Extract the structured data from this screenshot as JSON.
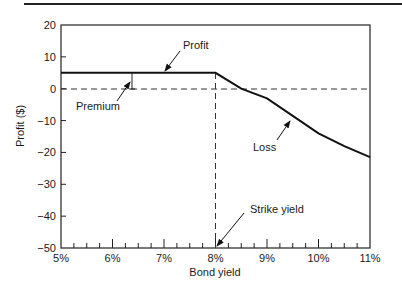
{
  "chart_data": {
    "type": "line",
    "title": "",
    "xlabel": "Bond yield",
    "ylabel": "Profit ($)",
    "xlim": [
      5,
      11
    ],
    "ylim": [
      -50,
      20
    ],
    "x_ticks": [
      "5%",
      "6%",
      "7%",
      "8%",
      "9%",
      "10%",
      "11%"
    ],
    "y_ticks": [
      "20",
      "10",
      "0",
      "−10",
      "−20",
      "−30",
      "−40",
      "−50"
    ],
    "grid": false,
    "legend": null,
    "series": [
      {
        "name": "Profit/Loss",
        "x": [
          5.0,
          8.0,
          8.5,
          9.0,
          9.5,
          10.0,
          10.5,
          11.0
        ],
        "y": [
          5,
          5,
          0,
          -3,
          -8.5,
          -14,
          -18,
          -21.5
        ]
      }
    ],
    "reference_lines": [
      {
        "type": "horizontal",
        "y": 0,
        "style": "dashed"
      },
      {
        "type": "vertical",
        "x": 8.0,
        "style": "dashed"
      }
    ],
    "annotations": [
      {
        "text": "Profit",
        "target_x": 6.7,
        "target_y": 5
      },
      {
        "text": "Premium",
        "target_x": 6.4,
        "target_y": 2.5
      },
      {
        "text": "Loss",
        "target_x": 9.5,
        "target_y": -10
      },
      {
        "text": "Strike yield",
        "target_x": 8.0,
        "target_y": -50
      }
    ]
  }
}
